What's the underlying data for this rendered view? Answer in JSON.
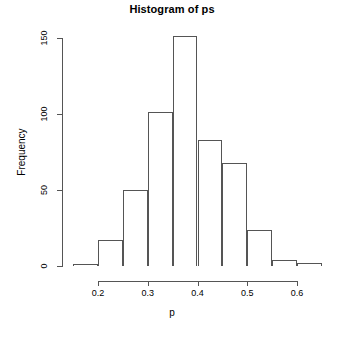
{
  "chart_data": {
    "type": "bar",
    "subtype": "histogram",
    "title": "Histogram of ps",
    "xlabel": "p",
    "ylabel": "Frequency",
    "grid": false,
    "legend": null,
    "xlim": [
      0.15,
      0.65
    ],
    "ylim": [
      0,
      150
    ],
    "bin_width": 0.05,
    "x_tick_labels": [
      "0.2",
      "0.3",
      "0.4",
      "0.5",
      "0.6"
    ],
    "x_tick_values": [
      0.2,
      0.3,
      0.4,
      0.5,
      0.6
    ],
    "y_tick_labels": [
      "0",
      "50",
      "100",
      "150"
    ],
    "y_tick_values": [
      0,
      50,
      100,
      150
    ],
    "bins": [
      {
        "label": "0.15-0.20",
        "left": 0.15,
        "right": 0.2,
        "value": 1
      },
      {
        "label": "0.20-0.25",
        "left": 0.2,
        "right": 0.25,
        "value": 17
      },
      {
        "label": "0.25-0.30",
        "left": 0.25,
        "right": 0.3,
        "value": 50
      },
      {
        "label": "0.30-0.35",
        "left": 0.3,
        "right": 0.35,
        "value": 101
      },
      {
        "label": "0.35-0.40",
        "left": 0.35,
        "right": 0.4,
        "value": 151
      },
      {
        "label": "0.40-0.45",
        "left": 0.4,
        "right": 0.45,
        "value": 83
      },
      {
        "label": "0.45-0.50",
        "left": 0.45,
        "right": 0.5,
        "value": 68
      },
      {
        "label": "0.50-0.55",
        "left": 0.5,
        "right": 0.55,
        "value": 24
      },
      {
        "label": "0.55-0.60",
        "left": 0.55,
        "right": 0.6,
        "value": 4
      },
      {
        "label": "0.60-0.65",
        "left": 0.6,
        "right": 0.65,
        "value": 2
      }
    ],
    "categories": [
      "0.15-0.20",
      "0.20-0.25",
      "0.25-0.30",
      "0.30-0.35",
      "0.35-0.40",
      "0.40-0.45",
      "0.45-0.50",
      "0.50-0.55",
      "0.55-0.60",
      "0.60-0.65"
    ],
    "values": [
      1,
      17,
      50,
      101,
      151,
      83,
      68,
      24,
      4,
      2
    ],
    "colors": {
      "background": "#ffffff",
      "bar_outline": "#555555",
      "bar_fill": "transparent",
      "axis": "#555555",
      "text": "#000000"
    }
  },
  "geometry": {
    "x_axis_y": 281,
    "y_axis_x": 62,
    "plot_bottom_y": 266,
    "plot_top_y": 38,
    "x_at_left_limit": 73,
    "x_at_right_limit": 322
  }
}
